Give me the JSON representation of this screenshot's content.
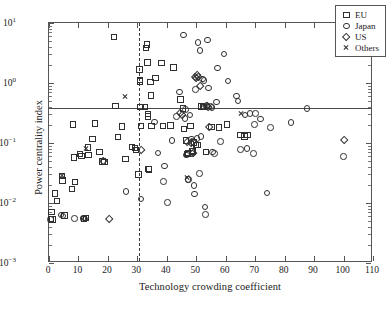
{
  "chart_data": {
    "type": "scatter",
    "title": "",
    "xlabel": "Technology crowding coefficient",
    "ylabel": "Power centrality index",
    "xlim": [
      0,
      110
    ],
    "ylim": [
      0.001,
      10
    ],
    "yscale": "log",
    "xscale": "linear",
    "grid": false,
    "legend_position": "top-right",
    "xticks": [
      "0",
      "10",
      "20",
      "30",
      "40",
      "50",
      "60",
      "70",
      "80",
      "90",
      "100",
      "110"
    ],
    "xtick_values": [
      0,
      10,
      20,
      30,
      40,
      50,
      60,
      70,
      80,
      90,
      100,
      110
    ],
    "yticks": [
      "10³−",
      "10²−",
      "10¹−",
      "10⁰",
      "10¹"
    ],
    "ytick_values": [
      0.001,
      0.01,
      0.1,
      1,
      10
    ],
    "ytick_labels": [
      {
        "base": "10",
        "exp": "-3",
        "value": 0.001
      },
      {
        "base": "10",
        "exp": "-2",
        "value": 0.01
      },
      {
        "base": "10",
        "exp": "-1",
        "value": 0.1
      },
      {
        "base": "10",
        "exp": "0",
        "value": 1
      },
      {
        "base": "10",
        "exp": "1",
        "value": 10
      }
    ],
    "annotations": [
      {
        "kind": "hline",
        "name": "power-centrality-threshold",
        "y": 0.39,
        "style": "solid",
        "color": "#4a4a4a"
      },
      {
        "kind": "vline",
        "name": "technology-crowding-threshold",
        "x": 30.6,
        "style": "dashed",
        "color": "#3a3a3a"
      }
    ],
    "series": [
      {
        "name": "EU",
        "marker": "square",
        "color": "#303030",
        "points": [
          [
            0.6,
            0.0073
          ],
          [
            0.5,
            0.0056
          ],
          [
            1.0,
            0.0054
          ],
          [
            1.8,
            0.0147
          ],
          [
            2.6,
            0.0111
          ],
          [
            4.2,
            0.0291
          ],
          [
            4.4,
            0.0243
          ],
          [
            5.0,
            0.0063
          ],
          [
            7.6,
            0.0175
          ],
          [
            8.0,
            0.2077
          ],
          [
            8.2,
            0.0585
          ],
          [
            8.6,
            0.0227
          ],
          [
            10.4,
            0.0666
          ],
          [
            10.8,
            0.062
          ],
          [
            11.6,
            0.0055
          ],
          [
            12.4,
            0.0057
          ],
          [
            13.0,
            0.0858
          ],
          [
            13.2,
            0.0645
          ],
          [
            14.6,
            0.118
          ],
          [
            15.4,
            0.2148
          ],
          [
            17.0,
            0.072
          ],
          [
            18.0,
            0.0505
          ],
          [
            18.6,
            0.0498
          ],
          [
            21.8,
            6.0
          ],
          [
            22.4,
            0.42
          ],
          [
            23.2,
            0.129
          ],
          [
            24.6,
            0.194
          ],
          [
            25.8,
            0.0549
          ],
          [
            28.0,
            0.088
          ],
          [
            29.0,
            0.0846
          ],
          [
            29.4,
            0.078
          ],
          [
            30.2,
            0.0306
          ],
          [
            30.5,
            1.72
          ],
          [
            30.6,
            1.14
          ],
          [
            30.7,
            1.09
          ],
          [
            30.8,
            0.406
          ],
          [
            31.0,
            0.196
          ],
          [
            32.4,
            0.409
          ],
          [
            32.8,
            3.95
          ],
          [
            33.0,
            4.5
          ],
          [
            33.2,
            2.25
          ],
          [
            33.4,
            0.308
          ],
          [
            33.5,
            0.284
          ],
          [
            33.6,
            0.038
          ],
          [
            33.8,
            0.0372
          ],
          [
            34.2,
            1.07
          ],
          [
            34.4,
            0.63
          ],
          [
            34.6,
            0.198
          ],
          [
            36.0,
            1.25
          ],
          [
            38.0,
            2.2
          ],
          [
            38.6,
            0.196
          ],
          [
            41.0,
            0.2
          ],
          [
            42.0,
            1.86
          ],
          [
            44.4,
            0.542
          ],
          [
            45.2,
            0.387
          ],
          [
            45.6,
            0.175
          ],
          [
            46.4,
            0.112
          ],
          [
            46.8,
            0.0675
          ],
          [
            47.0,
            0.069
          ],
          [
            47.8,
            0.198
          ],
          [
            48.4,
            0.0755
          ],
          [
            48.6,
            0.074
          ],
          [
            49.0,
            0.104
          ],
          [
            49.8,
            0.0958
          ],
          [
            50.2,
            0.0946
          ],
          [
            51.6,
            0.413
          ],
          [
            52.0,
            0.403
          ],
          [
            52.4,
            0.41
          ],
          [
            53.0,
            0.072
          ],
          [
            55.0,
            0.19
          ],
          [
            57.6,
            0.186
          ],
          [
            60.2,
            0.209
          ],
          [
            64.8,
            0.138
          ],
          [
            66.2,
            0.132
          ],
          [
            67.2,
            0.14
          ]
        ]
      },
      {
        "name": "Japan",
        "marker": "circle",
        "color": "#303030",
        "points": [
          [
            0.4,
            0.0054
          ],
          [
            3.8,
            0.0065
          ],
          [
            4.6,
            0.0062
          ],
          [
            8.4,
            0.0057
          ],
          [
            11.4,
            0.0056
          ],
          [
            12.0,
            0.0055
          ],
          [
            26.0,
            0.016
          ],
          [
            31.0,
            0.012
          ],
          [
            35.6,
            0.229
          ],
          [
            36.8,
            0.07
          ],
          [
            38.6,
            0.0232
          ],
          [
            39.0,
            0.0425
          ],
          [
            40.0,
            0.0104
          ],
          [
            41.6,
            0.112
          ],
          [
            43.0,
            0.283
          ],
          [
            44.0,
            0.72
          ],
          [
            45.4,
            6.5
          ],
          [
            46.0,
            0.26
          ],
          [
            46.2,
            0.368
          ],
          [
            46.4,
            0.065
          ],
          [
            47.0,
            0.0255
          ],
          [
            47.2,
            0.0251
          ],
          [
            47.6,
            0.302
          ],
          [
            48.2,
            0.12
          ],
          [
            48.4,
            0.069
          ],
          [
            48.6,
            0.108
          ],
          [
            49.0,
            0.0201
          ],
          [
            49.2,
            0.0145
          ],
          [
            49.6,
            0.79
          ],
          [
            50.0,
            0.123
          ],
          [
            50.4,
            4.85
          ],
          [
            50.8,
            0.0314
          ],
          [
            51.0,
            3.55
          ],
          [
            51.4,
            0.131
          ],
          [
            52.0,
            1.2
          ],
          [
            52.4,
            1.12
          ],
          [
            52.8,
            0.0088
          ],
          [
            53.0,
            0.0066
          ],
          [
            53.6,
            5.3
          ],
          [
            54.0,
            0.84
          ],
          [
            54.6,
            0.412
          ],
          [
            55.2,
            0.404
          ],
          [
            55.4,
            0.072
          ],
          [
            56.0,
            0.069
          ],
          [
            56.6,
            0.49
          ],
          [
            57.0,
            1.82
          ],
          [
            58.0,
            0.109
          ],
          [
            59.2,
            3.1
          ],
          [
            60.6,
            1.1
          ],
          [
            63.4,
            0.62
          ],
          [
            64.0,
            0.51
          ],
          [
            64.8,
            0.079
          ],
          [
            66.4,
            0.302
          ],
          [
            67.0,
            0.083
          ],
          [
            68.0,
            0.315
          ],
          [
            69.2,
            0.069
          ],
          [
            69.6,
            0.206
          ],
          [
            70.0,
            0.316
          ],
          [
            71.6,
            0.258
          ],
          [
            73.8,
            0.015
          ],
          [
            75.0,
            0.184
          ],
          [
            82.0,
            0.223
          ],
          [
            87.4,
            0.386
          ],
          [
            99.8,
            0.0615
          ]
        ]
      },
      {
        "name": "US",
        "marker": "diamond",
        "color": "#303030",
        "points": [
          [
            18.2,
            0.051
          ],
          [
            20.4,
            0.0055
          ],
          [
            31.0,
            0.078
          ],
          [
            44.2,
            0.32
          ],
          [
            45.0,
            0.295
          ],
          [
            46.6,
            0.106
          ],
          [
            48.0,
            0.102
          ],
          [
            48.8,
            0.07
          ],
          [
            49.4,
            1.3
          ],
          [
            49.8,
            1.21
          ],
          [
            50.0,
            1.38
          ],
          [
            50.6,
            1.27
          ],
          [
            51.2,
            0.9
          ],
          [
            53.0,
            0.415
          ],
          [
            53.4,
            0.42
          ],
          [
            53.8,
            0.406
          ],
          [
            54.2,
            0.185
          ],
          [
            100.0,
            0.116
          ]
        ]
      },
      {
        "name": "Others",
        "marker": "x",
        "color": "#303030",
        "points": [
          [
            4.4,
            0.0292
          ],
          [
            12.4,
            0.082
          ],
          [
            25.8,
            0.59
          ],
          [
            46.8,
            0.0265
          ],
          [
            65.2,
            0.308
          ]
        ]
      }
    ]
  },
  "legend": {
    "entries": [
      {
        "label": "EU",
        "marker": "square"
      },
      {
        "label": "Japan",
        "marker": "circle"
      },
      {
        "label": "US",
        "marker": "diamond"
      },
      {
        "label": "Others",
        "marker": "x"
      }
    ]
  },
  "axes": {
    "x_title": "Technology crowding coefficient",
    "y_title": "Power centrality index"
  }
}
